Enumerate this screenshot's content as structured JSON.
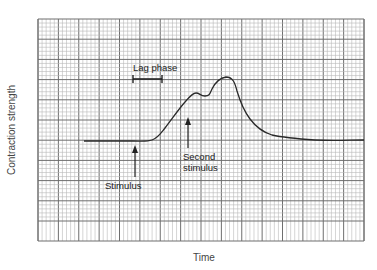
{
  "chart_data": {
    "type": "line",
    "title": "",
    "xlabel": "Time",
    "ylabel": "Contraction strength",
    "grid": true,
    "legend": null,
    "x": [
      0,
      10,
      20,
      25,
      30,
      35,
      40,
      45,
      50,
      55,
      60,
      65,
      70,
      75,
      80,
      90,
      100,
      110,
      120
    ],
    "series": [
      {
        "name": "Muscle contraction",
        "values": [
          0,
          0,
          0,
          0,
          0.3,
          1.5,
          3.0,
          4.1,
          4.0,
          4.9,
          5.1,
          3.8,
          2.2,
          1.1,
          0.6,
          0.3,
          0.15,
          0.1,
          0.1
        ]
      }
    ],
    "annotations": [
      {
        "text": "Lag phase",
        "type": "interval-bar"
      },
      {
        "text": "Stimulus",
        "type": "arrow-up"
      },
      {
        "text": "Second stimulus",
        "type": "arrow-up"
      }
    ]
  },
  "labels": {
    "xlabel": "Time",
    "ylabel": "Contraction strength",
    "lag_phase": "Lag phase",
    "stimulus": "Stimulus",
    "second_stimulus_line1": "Second",
    "second_stimulus_line2": "stimulus"
  },
  "colors": {
    "grid_minor": "#b8b8b8",
    "grid_major": "#6e6e6e",
    "curve": "#2a2a2a"
  }
}
